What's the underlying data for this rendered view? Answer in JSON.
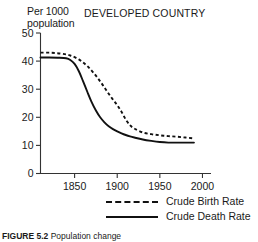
{
  "chart_data": {
    "type": "line",
    "title": "DEVELOPED COUNTRY",
    "xlabel": "",
    "ylabel": "Per 1000 population",
    "ylabel_line1": "Per 1000",
    "ylabel_line2": "population",
    "xlim": [
      1810,
      2010
    ],
    "ylim": [
      0,
      50
    ],
    "grid": false,
    "legend_position": "bottom-right",
    "xticks": [
      1850,
      1900,
      1950,
      2000
    ],
    "yticks": [
      0,
      10,
      20,
      30,
      40,
      50
    ],
    "x": [
      1810,
      1820,
      1830,
      1840,
      1845,
      1850,
      1855,
      1860,
      1865,
      1870,
      1875,
      1880,
      1885,
      1890,
      1895,
      1900,
      1905,
      1910,
      1915,
      1920,
      1930,
      1940,
      1950,
      1960,
      1970,
      1980,
      1990
    ],
    "series": [
      {
        "name": "Crude Birth Rate",
        "style": "dashed",
        "color": "#111111",
        "values": [
          43.0,
          43.0,
          42.8,
          42.4,
          42.0,
          41.4,
          40.6,
          39.5,
          38.2,
          36.6,
          34.8,
          32.8,
          30.6,
          28.4,
          26.3,
          24.3,
          22.0,
          19.2,
          17.2,
          16.0,
          14.6,
          14.0,
          13.6,
          13.3,
          13.1,
          12.8,
          12.5
        ]
      },
      {
        "name": "Crude Death Rate",
        "style": "solid",
        "color": "#111111",
        "values": [
          41.3,
          41.3,
          41.2,
          41.0,
          40.4,
          39.0,
          36.4,
          32.8,
          29.0,
          25.4,
          22.4,
          20.0,
          18.2,
          16.8,
          15.8,
          15.0,
          14.3,
          13.7,
          13.2,
          12.8,
          12.1,
          11.6,
          11.2,
          11.0,
          11.0,
          11.0,
          11.0
        ]
      }
    ],
    "annotations": []
  },
  "legend": {
    "items": [
      {
        "label": "Crude Birth Rate",
        "style": "dashed"
      },
      {
        "label": "Crude Death Rate",
        "style": "solid"
      }
    ]
  },
  "caption": {
    "number": "FIGURE 5.2",
    "text": "Population change"
  },
  "colors": {
    "line": "#111111",
    "axis": "#333333",
    "text": "#1a1a1a",
    "background": "#ffffff"
  }
}
